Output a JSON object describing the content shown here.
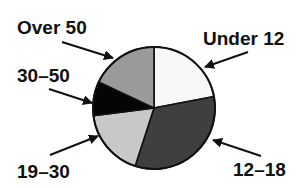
{
  "chart_data": {
    "type": "pie",
    "title": "",
    "categories": [
      "Under 12",
      "12–18",
      "19–30",
      "30–50",
      "Over 50"
    ],
    "values": [
      22,
      33,
      18,
      9,
      18
    ],
    "unit": "percent (estimated from slice angles)",
    "start_angle_deg": 0,
    "direction": "clockwise",
    "slice_colors": [
      "#f7f7f7",
      "#3f3f3f",
      "#c8c8c8",
      "#050505",
      "#9a9a9a"
    ],
    "legend": "none (labels with arrows)",
    "labels": [
      {
        "text": "Under 12",
        "x": 203,
        "y": 45,
        "arrow": [
          248,
          52,
          205,
          67
        ]
      },
      {
        "text": "12–18",
        "x": 233,
        "y": 176,
        "arrow": [
          261,
          156,
          213,
          140
        ]
      },
      {
        "text": "19–30",
        "x": 17,
        "y": 178,
        "arrow": [
          50,
          155,
          98,
          136
        ]
      },
      {
        "text": "30–50",
        "x": 17,
        "y": 82,
        "arrow": [
          49,
          89,
          92,
          103
        ]
      },
      {
        "text": "Over 50",
        "x": 17,
        "y": 34,
        "arrow": [
          62,
          42,
          113,
          58
        ]
      }
    ],
    "center": [
      154,
      108
    ],
    "radius": 61
  }
}
